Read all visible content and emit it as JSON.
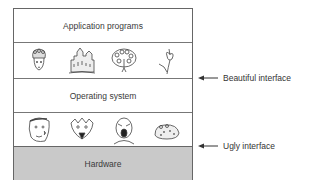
{
  "diagram": {
    "layers": [
      {
        "id": "application",
        "label": "Application programs"
      },
      {
        "id": "beautiful-pictures",
        "label": "",
        "pictures": [
          "woman-with-headdress",
          "castle",
          "peacock",
          "flower"
        ]
      },
      {
        "id": "operating-system",
        "label": "Operating system"
      },
      {
        "id": "ugly-pictures",
        "label": "",
        "pictures": [
          "grotesque-face",
          "snarling-creature",
          "screaming-man",
          "toad"
        ]
      },
      {
        "id": "hardware",
        "label": "Hardware",
        "fill": "#c9c9c9"
      }
    ],
    "callouts": [
      {
        "label": "Beautiful interface",
        "points_to": "boundary between beautiful pictures and operating system"
      },
      {
        "label": "Ugly interface",
        "points_to": "boundary between ugly pictures and hardware"
      }
    ]
  }
}
